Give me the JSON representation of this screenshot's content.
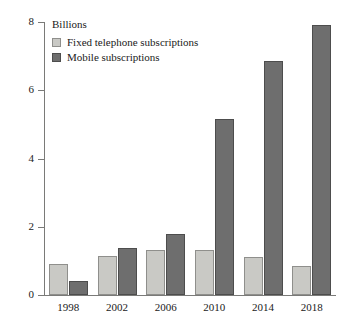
{
  "chart_data": {
    "type": "bar",
    "title": "",
    "unit_label": "Billions",
    "xlabel": "",
    "ylabel": "",
    "ylim": [
      0,
      8
    ],
    "yticks": [
      0,
      2,
      4,
      6,
      8
    ],
    "grid": false,
    "legend_position": "top-left",
    "categories": [
      "1998",
      "2002",
      "2006",
      "2010",
      "2014",
      "2018"
    ],
    "series": [
      {
        "name": "Fixed telephone subscriptions",
        "color": "#c9c9c5",
        "values": [
          0.9,
          1.15,
          1.32,
          1.32,
          1.12,
          0.86
        ]
      },
      {
        "name": "Mobile subscriptions",
        "color": "#6e6e6e",
        "values": [
          0.42,
          1.38,
          1.78,
          5.15,
          6.85,
          7.9
        ]
      }
    ]
  }
}
